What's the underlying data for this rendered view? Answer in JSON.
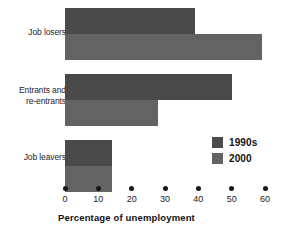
{
  "chart_data": {
    "type": "bar",
    "orientation": "horizontal",
    "title": "",
    "subtitle": "",
    "xlabel": "Percentage of unemployment",
    "ylabel": "",
    "categories": [
      "Job losers",
      "Entrants and re-entrants",
      "Job leavers"
    ],
    "category_lines": [
      [
        "Job losers"
      ],
      [
        "Entrants and",
        "re-entrants"
      ],
      [
        "Job leavers"
      ]
    ],
    "series": [
      {
        "name": "1990s",
        "color": "#4a4a4a",
        "values": [
          39,
          50,
          14
        ]
      },
      {
        "name": "2000",
        "color": "#636363",
        "values": [
          59,
          28,
          14
        ]
      }
    ],
    "xlim": [
      0,
      60
    ],
    "xticks": [
      0,
      10,
      20,
      30,
      40,
      50,
      60
    ],
    "xtick_labels": [
      "0",
      "10",
      "20",
      "30",
      "40",
      "50",
      "60"
    ],
    "grid": false,
    "legend_position": "inside-bottom-right",
    "tick_marker": "dot",
    "background": "#ffffff"
  },
  "legend": {
    "entries": [
      {
        "label": "1990s",
        "color": "#4a4a4a"
      },
      {
        "label": "2000",
        "color": "#636363"
      }
    ]
  }
}
